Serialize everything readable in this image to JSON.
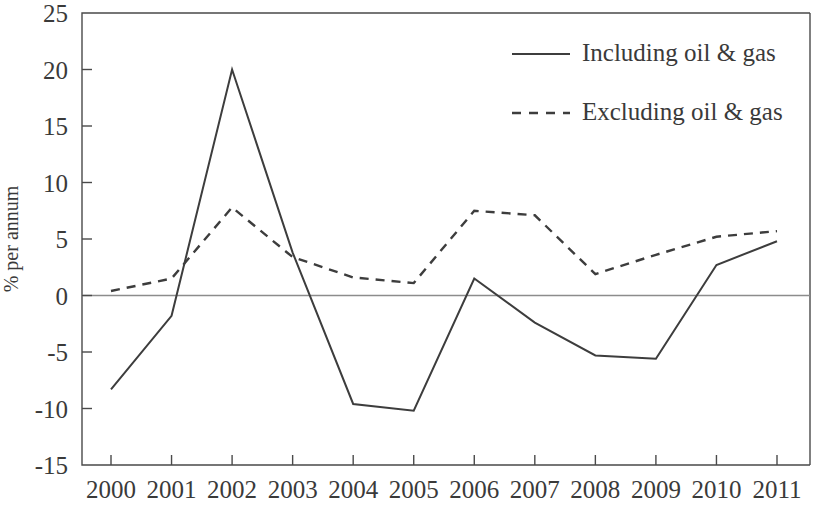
{
  "chart_data": {
    "type": "line",
    "title": "",
    "subtitle": "",
    "xlabel": "",
    "ylabel": "% per annum",
    "categories": [
      "2000",
      "2001",
      "2002",
      "2003",
      "2004",
      "2005",
      "2006",
      "2007",
      "2008",
      "2009",
      "2010",
      "2011"
    ],
    "x": [
      2000,
      2001,
      2002,
      2003,
      2004,
      2005,
      2006,
      2007,
      2008,
      2009,
      2010,
      2011
    ],
    "xlim": [
      2000,
      2011
    ],
    "ylim": [
      -15,
      25
    ],
    "y_ticks": [
      -15,
      -10,
      -5,
      0,
      5,
      10,
      15,
      20,
      25
    ],
    "y_tick_labels": [
      "-15",
      "-10",
      "-5",
      "0",
      "5",
      "10",
      "15",
      "20",
      "25"
    ],
    "x_tick_labels": [
      "2000",
      "2001",
      "2002",
      "2003",
      "2004",
      "2005",
      "2006",
      "2007",
      "2008",
      "2009",
      "2010",
      "2011"
    ],
    "grid": false,
    "zero_line": true,
    "legend_position": "top-right",
    "series": [
      {
        "name": "Including oil & gas",
        "style": "solid",
        "color": "#3d3d3d",
        "values": [
          -8.3,
          -1.8,
          20.0,
          3.8,
          -9.6,
          -10.2,
          1.5,
          -2.4,
          -5.3,
          -5.6,
          2.7,
          4.8
        ]
      },
      {
        "name": "Excluding oil & gas",
        "style": "dashed",
        "color": "#3d3d3d",
        "values": [
          0.4,
          1.5,
          7.8,
          3.4,
          1.6,
          1.1,
          7.5,
          7.1,
          1.9,
          3.6,
          5.2,
          5.7
        ]
      }
    ]
  },
  "legend": {
    "items": [
      {
        "label": "Including oil & gas",
        "style": "solid"
      },
      {
        "label": "Excluding oil & gas",
        "style": "dashed"
      }
    ]
  }
}
